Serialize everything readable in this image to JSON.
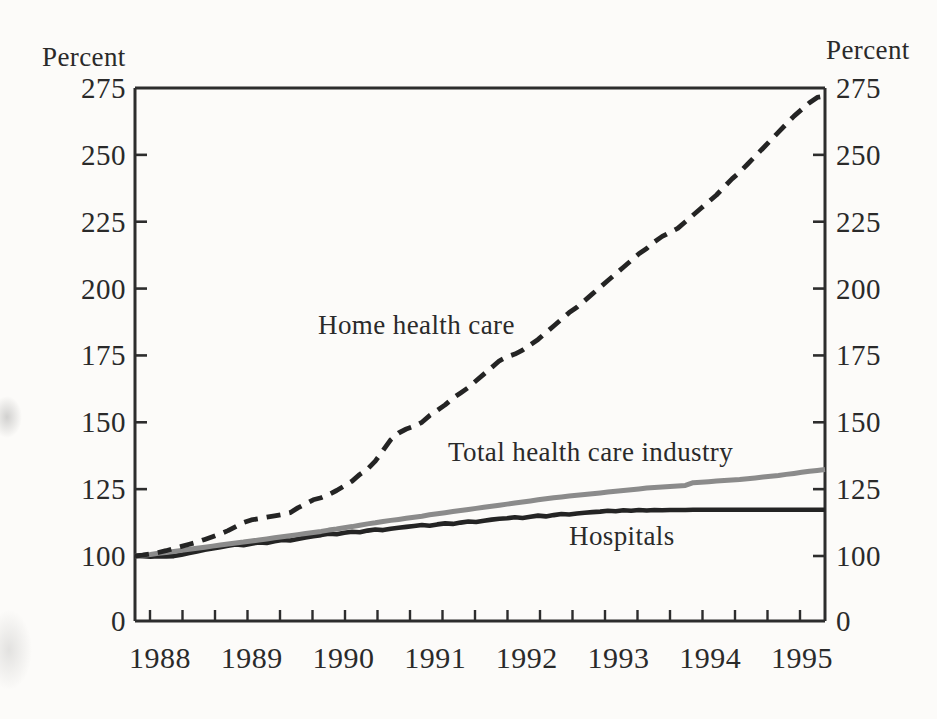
{
  "figure": {
    "background": "#fcfbf9",
    "text_color": "#2a2a2a",
    "axis_color": "#2d2d2d"
  },
  "chart_data": {
    "type": "line",
    "title": "",
    "xlabel": "",
    "ylabel_left": "Percent",
    "ylabel_right": "Percent",
    "y_axis": {
      "tick_values": [
        0,
        100,
        125,
        150,
        175,
        200,
        225,
        250,
        275
      ],
      "tick_labels": [
        "0",
        "100",
        "125",
        "150",
        "175",
        "200",
        "225",
        "250",
        "275"
      ],
      "side_tick_marks": [
        100,
        125,
        150,
        175,
        200,
        225,
        250
      ],
      "scale_break_below": 100,
      "ylim_upper_segment": [
        100,
        275
      ],
      "labels_on_both_sides": true,
      "grid": false
    },
    "x_axis": {
      "year_labels": [
        "1988",
        "1989",
        "1990",
        "1991",
        "1992",
        "1993",
        "1994",
        "1995"
      ],
      "minor_ticks_count": 21,
      "minor_tick_interval_months": 4,
      "start": "1988-01",
      "end": "1995-06",
      "frequency": "monthly"
    },
    "legend_position": "inline-annotations",
    "series": [
      {
        "name": "Home health care",
        "style": "dashed",
        "color": "#242424",
        "values": [
          100,
          100.3,
          100.8,
          101.3,
          102,
          102.8,
          103.6,
          104.4,
          105.2,
          106.2,
          107.2,
          108.3,
          109.5,
          111,
          112.5,
          113.5,
          114,
          114.5,
          115,
          115.5,
          116.2,
          118,
          119.5,
          121,
          121.8,
          123,
          124.5,
          126.2,
          128,
          130.5,
          132.5,
          135.5,
          139.5,
          143.5,
          146,
          147.5,
          148.5,
          150,
          152.5,
          154.5,
          156.5,
          159,
          161,
          163,
          165.5,
          168,
          170.5,
          173,
          174.5,
          175.5,
          177,
          179,
          181,
          183.5,
          186,
          188.5,
          191,
          193,
          195.5,
          198,
          200.5,
          203,
          205.5,
          208,
          210.5,
          213,
          215,
          217.5,
          219.5,
          221,
          222.5,
          225,
          227.5,
          230,
          232.5,
          235,
          238,
          241,
          243.5,
          246.5,
          249.5,
          252.5,
          255.5,
          258.5,
          261.5,
          264.5,
          267,
          269.5,
          271.5,
          272
        ]
      },
      {
        "name": "Total health care industry",
        "style": "solid",
        "color": "#8b8b8b",
        "values": [
          100,
          100.3,
          100.6,
          101,
          101.3,
          101.7,
          102.1,
          102.5,
          102.9,
          103.3,
          103.7,
          104.1,
          104.5,
          104.9,
          105.2,
          105.6,
          106,
          106.4,
          106.8,
          107.2,
          107.6,
          108,
          108.4,
          108.8,
          109.2,
          109.7,
          110.1,
          110.6,
          111,
          111.5,
          112,
          112.4,
          112.9,
          113.3,
          113.7,
          114.1,
          114.5,
          114.9,
          115.4,
          115.8,
          116.2,
          116.6,
          117,
          117.4,
          117.8,
          118.2,
          118.6,
          119,
          119.4,
          119.8,
          120.2,
          120.6,
          121,
          121.4,
          121.8,
          122.1,
          122.4,
          122.7,
          123,
          123.3,
          123.6,
          123.9,
          124.2,
          124.5,
          124.8,
          125.1,
          125.4,
          125.6,
          125.8,
          126,
          126.2,
          126.4,
          127.4,
          127.6,
          127.8,
          128,
          128.2,
          128.4,
          128.6,
          128.9,
          129.2,
          129.5,
          129.8,
          130.1,
          130.5,
          130.9,
          131.3,
          131.7,
          132,
          132.3
        ]
      },
      {
        "name": "Hospitals",
        "style": "solid",
        "color": "#242424",
        "values": [
          100,
          99.5,
          99.1,
          99.6,
          99.3,
          99.9,
          100.5,
          101.1,
          101.7,
          102.3,
          102.8,
          103.3,
          103.8,
          104.3,
          104,
          104.6,
          105.1,
          104.9,
          105.5,
          106,
          105.8,
          106.4,
          106.9,
          107.4,
          107.8,
          108.3,
          108.1,
          108.7,
          109.1,
          108.9,
          109.5,
          109.9,
          109.7,
          110.2,
          110.6,
          110.9,
          111.2,
          111.6,
          111.3,
          111.8,
          112.2,
          112,
          112.5,
          112.9,
          112.7,
          113.2,
          113.6,
          113.9,
          114.1,
          114.5,
          114.2,
          114.7,
          115.1,
          114.8,
          115.3,
          115.7,
          115.5,
          115.9,
          116.2,
          116.4,
          116.6,
          116.9,
          116.7,
          117.1,
          116.9,
          117.2,
          117,
          117.2,
          117.1,
          117.2,
          117.2,
          117.2,
          117.3,
          117.3,
          117.3,
          117.3,
          117.3,
          117.3,
          117.3,
          117.3,
          117.3,
          117.3,
          117.3,
          117.3,
          117.3,
          117.3,
          117.3,
          117.3,
          117.3,
          117.3
        ]
      }
    ],
    "annotations": [
      {
        "text": "Home health care",
        "series": 0
      },
      {
        "text": "Total health care industry",
        "series": 1
      },
      {
        "text": "Hospitals",
        "series": 2
      }
    ]
  }
}
